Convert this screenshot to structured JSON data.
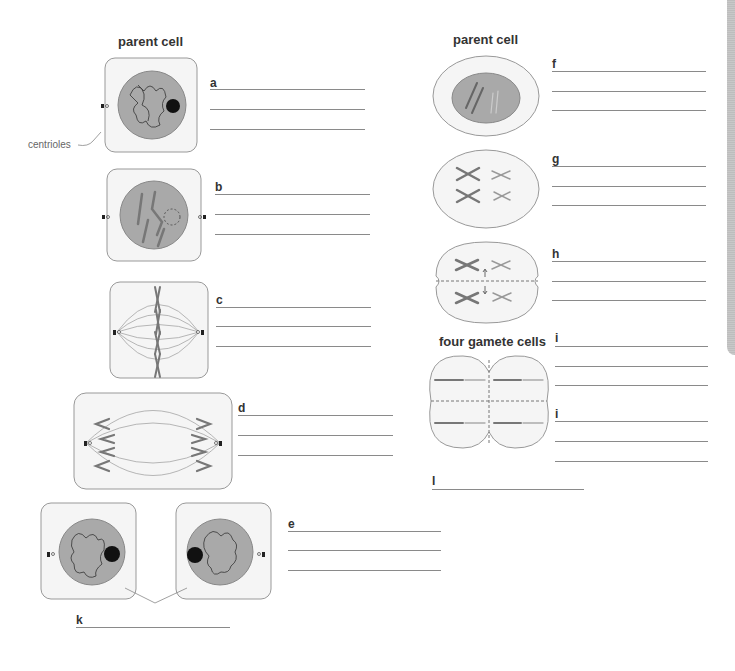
{
  "left_column": {
    "title": "parent cell",
    "centrioles_label": "centrioles",
    "stages": [
      {
        "label": "a"
      },
      {
        "label": "b"
      },
      {
        "label": "c"
      },
      {
        "label": "d"
      },
      {
        "label": "e"
      }
    ],
    "daughter_label": "k"
  },
  "right_column": {
    "title": "parent cell",
    "stages": [
      {
        "label": "f"
      },
      {
        "label": "g"
      },
      {
        "label": "h"
      },
      {
        "label": "i"
      },
      {
        "label": "i"
      }
    ],
    "gametes_title": "four gamete cells",
    "gametes_label": "l"
  },
  "colors": {
    "nucleus": "#a9a9a9",
    "cell_fill": "#f5f5f5",
    "outline": "#999999",
    "chromosome": "#7a7a7a",
    "answer_line": "#8a8a8a"
  }
}
